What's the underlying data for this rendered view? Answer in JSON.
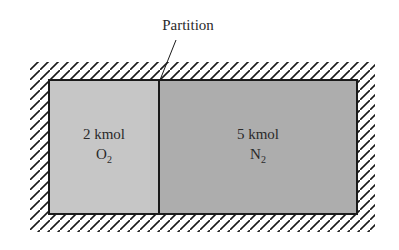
{
  "partition_label": "Partition",
  "left_chamber": {
    "amount": "2 kmol",
    "gas_base": "O",
    "gas_subscript": "2",
    "fill": "#c6c6c6"
  },
  "right_chamber": {
    "amount": "5 kmol",
    "gas_base": "N",
    "gas_subscript": "2",
    "fill": "#adadad"
  },
  "colors": {
    "outline": "#1a1a1a",
    "hatch": "#1a1a1a",
    "text": "#2a2a2a"
  }
}
